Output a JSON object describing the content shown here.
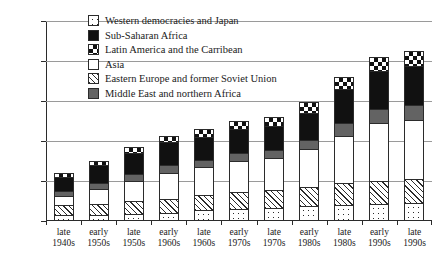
{
  "chart_data": {
    "type": "bar",
    "subtype": "stacked-bar",
    "title": "",
    "xlabel": "",
    "ylabel": "",
    "ylim": [
      0,
      250
    ],
    "yticks": [
      0,
      50,
      100,
      150,
      200,
      250
    ],
    "grid": true,
    "legend_position": "top-center",
    "categories": [
      "late 1940s",
      "early 1950s",
      "late 1950s",
      "early 1960s",
      "late 1960s",
      "early 1970s",
      "late 1970s",
      "early 1980s",
      "late 1980s",
      "early 1990s",
      "late 1990s"
    ],
    "categories_split": [
      {
        "line1": "late",
        "line2": "1940s"
      },
      {
        "line1": "early",
        "line2": "1950s"
      },
      {
        "line1": "late",
        "line2": "1950s"
      },
      {
        "line1": "early",
        "line2": "1960s"
      },
      {
        "line1": "late",
        "line2": "1960s"
      },
      {
        "line1": "early",
        "line2": "1970s"
      },
      {
        "line1": "late",
        "line2": "1970s"
      },
      {
        "line1": "early",
        "line2": "1980s"
      },
      {
        "line1": "late",
        "line2": "1980s"
      },
      {
        "line1": "early",
        "line2": "1990s"
      },
      {
        "line1": "late",
        "line2": "1990s"
      }
    ],
    "series": [
      {
        "name": "Western democracies and Japan",
        "pattern": "dots",
        "values": [
          5,
          5,
          6,
          8,
          11,
          13,
          14,
          16,
          18,
          19,
          20
        ]
      },
      {
        "name": "Eastern Europe and former Soviet Union",
        "pattern": "hatch",
        "values": [
          13,
          14,
          16,
          17,
          19,
          21,
          22,
          24,
          27,
          29,
          30
        ]
      },
      {
        "name": "Asia",
        "pattern": "white",
        "values": [
          11,
          19,
          26,
          33,
          35,
          38,
          40,
          47,
          59,
          72,
          74
        ]
      },
      {
        "name": "Middle East and northern Africa",
        "pattern": "gray",
        "values": [
          6,
          7,
          8,
          9,
          9,
          10,
          10,
          12,
          16,
          18,
          19
        ]
      },
      {
        "name": "Sub-Saharan Africa",
        "pattern": "black",
        "values": [
          18,
          22,
          27,
          29,
          29,
          30,
          30,
          34,
          42,
          47,
          48
        ]
      },
      {
        "name": "Latin America and the Carribean",
        "pattern": "check",
        "values": [
          5,
          6,
          7,
          8,
          9,
          11,
          11,
          13,
          16,
          18,
          19
        ]
      }
    ],
    "totals": [
      58,
      73,
      90,
      104,
      112,
      123,
      127,
      146,
      178,
      203,
      210
    ]
  },
  "legend": {
    "items": [
      {
        "label": "Western democracies and Japan",
        "pattern": "dots"
      },
      {
        "label": "Sub-Saharan Africa",
        "pattern": "black"
      },
      {
        "label": "Latin America and the Carribean",
        "pattern": "check"
      },
      {
        "label": "Asia",
        "pattern": "white"
      },
      {
        "label": "Eastern Europe and former Soviet Union",
        "pattern": "hatch"
      },
      {
        "label": "Middle East and northern Africa",
        "pattern": "gray"
      }
    ]
  },
  "axis": {
    "y_tick_labels": [
      "250",
      "200",
      "150",
      "100",
      "50",
      "0"
    ]
  },
  "colors": {
    "ink": "#1a1a1a",
    "axis": "#2b2b2b",
    "grid": "#9a9a9a",
    "gray_fill": "#636363",
    "black_fill": "#111111",
    "background": "#ffffff"
  }
}
